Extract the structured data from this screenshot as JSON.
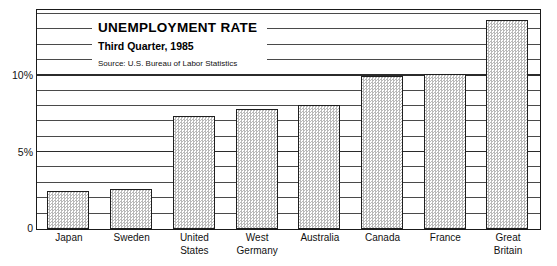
{
  "chart_data": {
    "type": "bar",
    "title": "UNEMPLOYMENT RATE",
    "subtitle": "Third Quarter, 1985",
    "source": "Source: U.S. Bureau of Labor Statistics",
    "xlabel": "",
    "ylabel": "",
    "categories": [
      "Japan",
      "Sweden",
      "United States",
      "West Germany",
      "Australia",
      "Canada",
      "France",
      "Great Britain"
    ],
    "category_lines": [
      [
        "Japan",
        ""
      ],
      [
        "Sweden",
        ""
      ],
      [
        "United",
        "States"
      ],
      [
        "West",
        "Germany"
      ],
      [
        "Australia",
        ""
      ],
      [
        "Canada",
        ""
      ],
      [
        "France",
        ""
      ],
      [
        "Great",
        "Britain"
      ]
    ],
    "values": [
      2.5,
      2.6,
      7.4,
      7.8,
      8.1,
      10.0,
      10.1,
      13.6
    ],
    "ylim": [
      0,
      14.2
    ],
    "ytick_values": [
      0,
      5,
      10
    ],
    "ytick_labels": [
      "0",
      "5%",
      "10%"
    ],
    "gridline_values": [
      1,
      2,
      3,
      4,
      5,
      6,
      7,
      8,
      9,
      10,
      11,
      12,
      13,
      14
    ],
    "grid": true,
    "legend": "none",
    "bar_fill": "#efefef",
    "bar_pattern": "stipple-checker",
    "bar_border_color": "#1f1f1f",
    "frame_color": "#1a1a1a",
    "gridline_color": "#4a4a4a",
    "background": "#ffffff"
  }
}
